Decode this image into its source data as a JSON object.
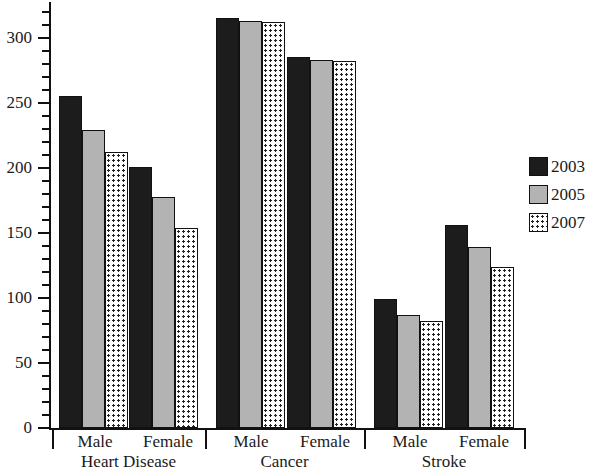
{
  "chart_data": {
    "type": "bar",
    "title": "",
    "xlabel": "",
    "ylabel": "",
    "ylim": [
      0,
      325
    ],
    "grid": false,
    "legend_position": "right",
    "y_ticks_major": [
      0,
      50,
      100,
      150,
      200,
      250,
      300
    ],
    "y_tick_labels": [
      "0",
      "50",
      "100",
      "150",
      "200",
      "250",
      "300"
    ],
    "y_minor_tick_step": 10,
    "groups": [
      "Heart Disease",
      "Cancer",
      "Stroke"
    ],
    "subgroups": [
      "Male",
      "Female"
    ],
    "categories": [
      "Heart Disease - Male",
      "Heart Disease - Female",
      "Cancer - Male",
      "Cancer - Female",
      "Stroke - Male",
      "Stroke - Female"
    ],
    "series": [
      {
        "name": "2003",
        "color": "#1c1c1c",
        "pattern": "solid-black",
        "values": [
          255,
          201,
          315,
          285,
          99,
          156
        ]
      },
      {
        "name": "2005",
        "color": "#b3b3b3",
        "pattern": "solid-gray",
        "values": [
          229,
          178,
          313,
          283,
          87,
          139
        ]
      },
      {
        "name": "2007",
        "color": "#ffffff",
        "pattern": "dotted",
        "values": [
          212,
          154,
          312,
          282,
          82,
          124
        ]
      }
    ]
  },
  "legend": {
    "entries": [
      {
        "label": "2003",
        "swatch": "legend-swatch-2003"
      },
      {
        "label": "2005",
        "swatch": "legend-swatch-2005"
      },
      {
        "label": "2007",
        "swatch": "legend-swatch-2007"
      }
    ]
  },
  "axis": {
    "y_labels": [
      "300",
      "250",
      "200",
      "150",
      "100",
      "50",
      "0"
    ],
    "x_subgroup_labels": [
      "Male",
      "Female",
      "Male",
      "Female",
      "Male",
      "Female"
    ],
    "x_group_labels": [
      "Heart Disease",
      "Cancer",
      "Stroke"
    ]
  }
}
